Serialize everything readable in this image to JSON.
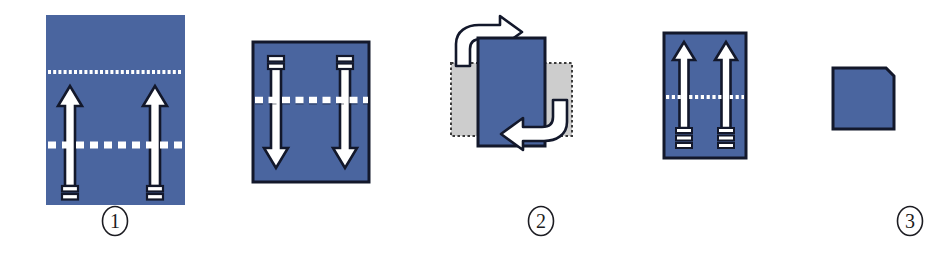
{
  "diagram": {
    "background_color": "#ffffff",
    "paper_color": "#4a659f",
    "paper_edge_color": "#13182b",
    "ghost_flap_color": "#cdcdcd",
    "ghost_flap_edge_color": "#3a3a3a",
    "arrow_fill_color": "#ffffff",
    "arrow_outline_color": "#13182b",
    "fold_line_color": "#ffffff",
    "label_color": "#1c1c22",
    "step_count": 5
  },
  "steps": [
    {
      "number": "1",
      "label": "①",
      "name": "step-one",
      "sheet": {
        "shape": "tall-rectangle",
        "x": 46,
        "y": 15,
        "width": 139,
        "height": 190,
        "fill": "#4a659f",
        "has_border": false
      },
      "fold_lines": [
        {
          "name": "upper-fine-dotted-fold-line",
          "style": "fine-dotted",
          "y": 72
        },
        {
          "name": "lower-dashed-fold-line",
          "style": "coarse-dashed",
          "y": 145
        }
      ],
      "arrows": [
        {
          "name": "left-up-arrow",
          "direction": "up",
          "x": 70,
          "tail_y": 196,
          "head_y": 86
        },
        {
          "name": "right-up-arrow",
          "direction": "up",
          "x": 155,
          "tail_y": 196,
          "head_y": 86
        }
      ],
      "label_x": 115,
      "label_y": 209
    },
    {
      "number": "2",
      "label": "②",
      "name": "step-two",
      "sheet": {
        "shape": "square",
        "x": 253,
        "y": 42,
        "width": 116,
        "height": 140,
        "fill": "#4a659f",
        "has_border": true
      },
      "fold_lines": [
        {
          "name": "middle-dashed-fold-line",
          "style": "coarse-dashed",
          "y": 100
        }
      ],
      "arrows": [
        {
          "name": "left-down-arrow",
          "direction": "down",
          "x": 276,
          "tail_y": 52,
          "head_y": 168
        },
        {
          "name": "right-down-arrow",
          "direction": "down",
          "x": 345,
          "tail_y": 52,
          "head_y": 168
        }
      ],
      "label_x": 311,
      "label_y": 209
    },
    {
      "number": "3",
      "label": "③",
      "name": "step-three",
      "sheet": {
        "shape": "tall-rectangle",
        "x": 478,
        "y": 38,
        "width": 67,
        "height": 108,
        "fill": "#4a659f",
        "has_border": true
      },
      "ghost_flaps": [
        {
          "name": "left-ghost-flap",
          "x": 451,
          "y": 63,
          "width": 28,
          "height": 73
        },
        {
          "name": "right-ghost-flap",
          "x": 544,
          "y": 63,
          "width": 28,
          "height": 73
        }
      ],
      "arrows": [
        {
          "name": "top-left-hook-arrow",
          "direction": "hook-right",
          "description": "curved arrow folding left flap to the right"
        },
        {
          "name": "bottom-right-hook-arrow",
          "direction": "hook-left",
          "description": "curved arrow folding right flap to the left"
        }
      ],
      "label_x": 500,
      "label_y": 209
    },
    {
      "number": "4",
      "label": "④",
      "name": "step-four",
      "sheet": {
        "shape": "tall-rectangle",
        "x": 664,
        "y": 33,
        "width": 82,
        "height": 125,
        "fill": "#4a659f",
        "has_border": true
      },
      "fold_lines": [
        {
          "name": "middle-fine-dotted-fold-line",
          "style": "fine-dotted",
          "y": 97
        }
      ],
      "arrows": [
        {
          "name": "left-up-arrow",
          "direction": "up",
          "x": 684,
          "tail_y": 150,
          "head_y": 42
        },
        {
          "name": "right-up-arrow",
          "direction": "up",
          "x": 726,
          "tail_y": 150,
          "head_y": 42
        }
      ],
      "label_x": 692,
      "label_y": 209
    },
    {
      "number": "5",
      "label": "⑤",
      "name": "step-five",
      "sheet": {
        "shape": "square-with-folded-corner",
        "x": 833,
        "y": 68,
        "width": 61,
        "height": 61,
        "fill": "#4a659f",
        "has_border": true,
        "corner_fold": "top-right"
      },
      "label_x": 869,
      "label_y": 209
    }
  ]
}
